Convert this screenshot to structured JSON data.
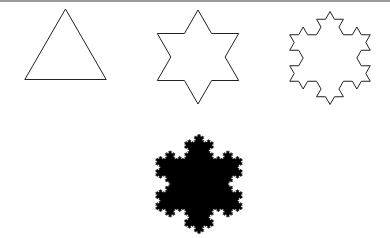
{
  "figure": {
    "stroke_color": "#222222",
    "fill_color": "#000000",
    "background": "#ffffff",
    "shapes": [
      {
        "name": "iteration-0-triangle",
        "level": 0,
        "cx": 65.5,
        "cy": 56,
        "r": 47,
        "filled": false,
        "rotation": -90
      },
      {
        "name": "iteration-1-star",
        "level": 1,
        "cx": 198,
        "cy": 57,
        "r": 47,
        "filled": false,
        "rotation": -90
      },
      {
        "name": "iteration-2-snowflake",
        "level": 2,
        "cx": 330,
        "cy": 58,
        "r": 46.5,
        "filled": false,
        "rotation": -90
      },
      {
        "name": "iteration-n-filled-snowflake",
        "level": 4,
        "cx": 199,
        "cy": 184,
        "r": 50,
        "filled": true,
        "rotation": -90
      }
    ]
  }
}
